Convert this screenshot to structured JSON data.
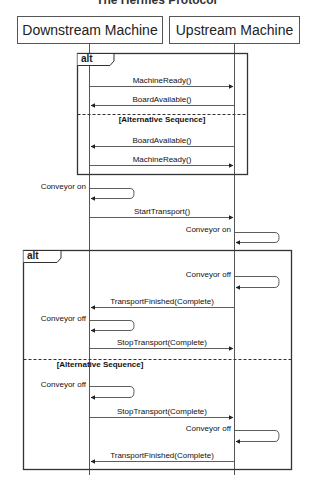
{
  "title": "The Hermes Protocol",
  "actors": [
    {
      "name": "Downstream Machine"
    },
    {
      "name": "Upstream Machine"
    }
  ],
  "fragments": [
    {
      "kind": "alt",
      "alt_label": "alt",
      "else_guard": "[Alternative Sequence]",
      "messages": [
        {
          "text": "MachineReady()",
          "from": "Downstream Machine",
          "to": "Upstream Machine"
        },
        {
          "text": "BoardAvailable()",
          "from": "Upstream Machine",
          "to": "Downstream Machine"
        },
        {
          "text": "BoardAvailable()",
          "from": "Upstream Machine",
          "to": "Downstream Machine"
        },
        {
          "text": "MachineReady()",
          "from": "Downstream Machine",
          "to": "Upstream Machine"
        }
      ]
    },
    {
      "kind": "sequence",
      "messages": [
        {
          "text": "Conveyor on",
          "from": "Downstream Machine",
          "to": "Downstream Machine"
        },
        {
          "text": "StartTransport()",
          "from": "Downstream Machine",
          "to": "Upstream Machine"
        },
        {
          "text": "Conveyor on",
          "from": "Upstream Machine",
          "to": "Upstream Machine"
        }
      ]
    },
    {
      "kind": "alt",
      "alt_label": "alt",
      "else_guard": "[Alternative Sequence]",
      "messages": [
        {
          "text": "Conveyor off",
          "from": "Upstream Machine",
          "to": "Upstream Machine"
        },
        {
          "text": "TransportFinished(Complete)",
          "from": "Upstream Machine",
          "to": "Downstream Machine"
        },
        {
          "text": "Conveyor off",
          "from": "Downstream Machine",
          "to": "Downstream Machine"
        },
        {
          "text": "StopTransport(Complete)",
          "from": "Downstream Machine",
          "to": "Upstream Machine"
        },
        {
          "text": "Conveyor off",
          "from": "Downstream Machine",
          "to": "Downstream Machine"
        },
        {
          "text": "StopTransport(Complete)",
          "from": "Downstream Machine",
          "to": "Upstream Machine"
        },
        {
          "text": "Conveyor off",
          "from": "Upstream Machine",
          "to": "Upstream Machine"
        },
        {
          "text": "TransportFinished(Complete)",
          "from": "Upstream Machine",
          "to": "Downstream Machine"
        }
      ]
    }
  ]
}
